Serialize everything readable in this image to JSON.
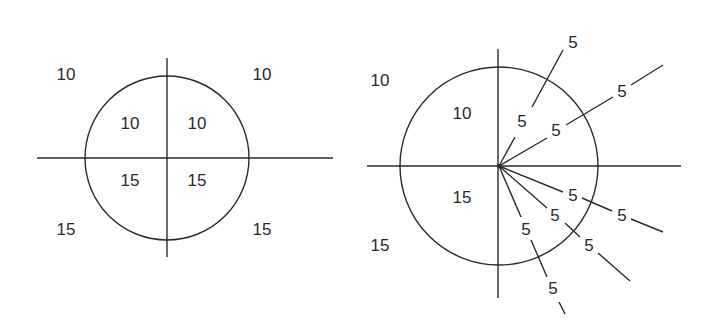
{
  "colors": {
    "stroke": "#2a2a2a",
    "background": "#ffffff"
  },
  "left_diagram": {
    "description": "Circle divided into four quadrants by perpendicular axes",
    "labels": {
      "outer_top_left": "10",
      "outer_top_right": "10",
      "inner_top_left": "10",
      "inner_top_right": "10",
      "inner_bottom_left": "15",
      "inner_bottom_right": "15",
      "outer_bottom_left": "15",
      "outer_bottom_right": "15"
    }
  },
  "right_diagram": {
    "description": "Circle divided by axes; right half subdivided by five radial rays with labels inside and outside the circle",
    "labels": {
      "outer_top_left": "10",
      "inner_top_left": "10",
      "inner_bottom_left": "15",
      "outer_bottom_left": "15",
      "ray1_inner": "5",
      "ray1_outer": "5",
      "ray2_inner": "5",
      "ray2_outer": "5",
      "ray3_inner": "5",
      "ray3_outer": "5",
      "ray4_inner": "5",
      "ray4_outer": "5",
      "ray5_inner": "5",
      "ray5_outer": "5"
    }
  }
}
